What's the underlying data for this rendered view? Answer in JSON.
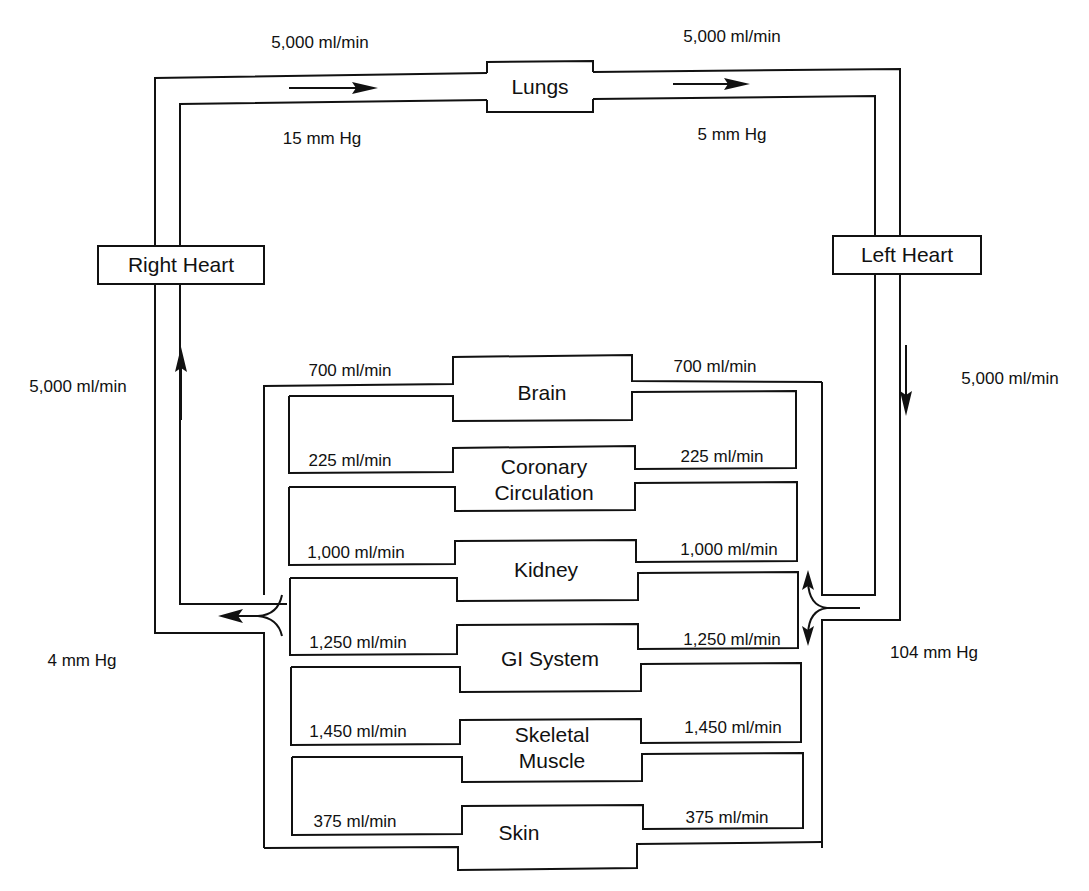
{
  "diagram": {
    "type": "circulatory-flow-diagram",
    "components": {
      "lungs": "Lungs",
      "right_heart": "Right Heart",
      "left_heart": "Left Heart"
    },
    "pulmonary": {
      "flow_in": "5,000 ml/min",
      "flow_out": "5,000 ml/min",
      "pressure_in": "15 mm Hg",
      "pressure_out": "5 mm Hg"
    },
    "systemic": {
      "venous_return_flow": "5,000 ml/min",
      "arterial_flow": "5,000 ml/min",
      "venous_pressure": "4 mm Hg",
      "arterial_pressure": "104 mm Hg"
    },
    "organs": [
      {
        "name": "Brain",
        "line1": "Brain",
        "line2": "",
        "flow_left": "700 ml/min",
        "flow_right": "700 ml/min"
      },
      {
        "name": "Coronary Circulation",
        "line1": "Coronary",
        "line2": "Circulation",
        "flow_left": "225 ml/min",
        "flow_right": "225 ml/min"
      },
      {
        "name": "Kidney",
        "line1": "Kidney",
        "line2": "",
        "flow_left": "1,000 ml/min",
        "flow_right": "1,000 ml/min"
      },
      {
        "name": "GI System",
        "line1": "GI System",
        "line2": "",
        "flow_left": "1,250 ml/min",
        "flow_right": "1,250 ml/min"
      },
      {
        "name": "Skeletal Muscle",
        "line1": "Skeletal",
        "line2": "Muscle",
        "flow_left": "1,450 ml/min",
        "flow_right": "1,450 ml/min"
      },
      {
        "name": "Skin",
        "line1": "Skin",
        "line2": "",
        "flow_left": "375 ml/min",
        "flow_right": "375 ml/min"
      }
    ]
  }
}
